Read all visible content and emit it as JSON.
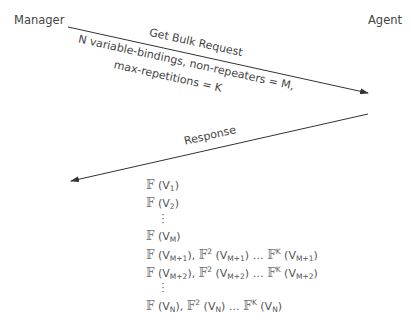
{
  "participants": {
    "manager": "Manager",
    "agent": "Agent"
  },
  "request": {
    "title": "Get Bulk Request",
    "line1": "N variable-bindings, non-repeaters = M,",
    "line2": "max-repetitions = K"
  },
  "response": {
    "title": "Response"
  },
  "rows": {
    "r1": {
      "f": "𝔽",
      "open": " (V",
      "sub": "1",
      "close": ")"
    },
    "r2": {
      "f": "𝔽",
      "open": " (V",
      "sub": "2",
      "close": ")"
    },
    "rM": {
      "f": "𝔽",
      "open": " (V",
      "sub": "M",
      "close": ")"
    },
    "rM1": {
      "f": "𝔽",
      "a": " (V",
      "s1": "M+1",
      "b": "), ",
      "f2": "𝔽",
      "p2": "2",
      "c": " (V",
      "s2": "M+1",
      "d": ") … ",
      "fk": "𝔽",
      "pk": "K",
      "e": " (V",
      "s3": "M+1",
      "g": ")"
    },
    "rM2": {
      "f": "𝔽",
      "a": " (V",
      "s1": "M+2",
      "b": "), ",
      "f2": "𝔽",
      "p2": "2",
      "c": " (V",
      "s2": "M+2",
      "d": ") … ",
      "fk": "𝔽",
      "pk": "K",
      "e": " (V",
      "s3": "M+2",
      "g": ")"
    },
    "rN": {
      "f": "𝔽",
      "a": " (V",
      "s1": "N",
      "b": "), ",
      "f2": "𝔽",
      "p2": "2",
      "c": " (V",
      "s2": "N",
      "d": ") … ",
      "fk": "𝔽",
      "pk": "K",
      "e": " (V",
      "s3": "N",
      "g": ")"
    }
  },
  "colors": {
    "line": "#333333",
    "text": "#444444"
  }
}
